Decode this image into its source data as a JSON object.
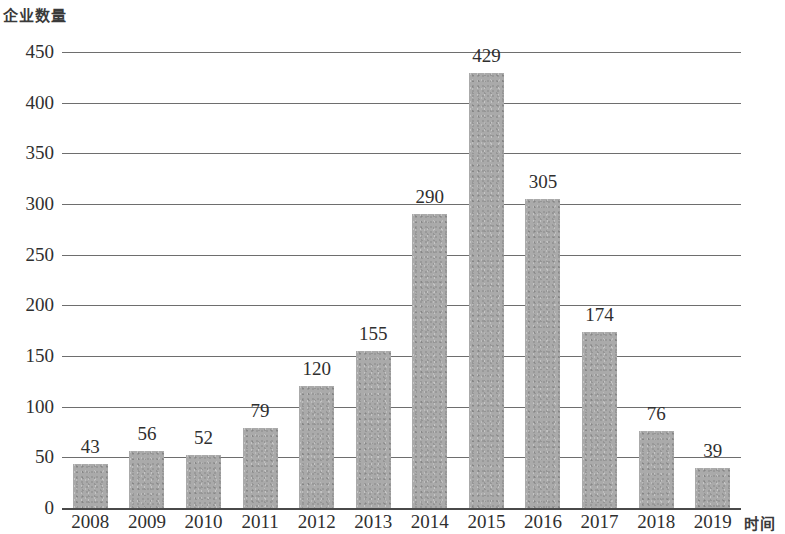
{
  "chart_data": {
    "type": "bar",
    "title": "",
    "ylabel": "企业数量",
    "xlabel": "时间",
    "categories": [
      "2008",
      "2009",
      "2010",
      "2011",
      "2012",
      "2013",
      "2014",
      "2015",
      "2016",
      "2017",
      "2018",
      "2019"
    ],
    "values": [
      43,
      56,
      52,
      79,
      120,
      155,
      290,
      429,
      305,
      174,
      76,
      39
    ],
    "value_labels": [
      "43",
      "56",
      "52",
      "79",
      "120",
      "155",
      "290",
      "429",
      "305",
      "174",
      "76",
      "39"
    ],
    "ylim": [
      0,
      450
    ],
    "ytick_labels": [
      "450",
      "400",
      "350",
      "300",
      "250",
      "200",
      "150",
      "100",
      "50",
      "0"
    ],
    "ytick_values": [
      450,
      400,
      350,
      300,
      250,
      200,
      150,
      100,
      50,
      0
    ],
    "ytick_step": 50,
    "grid": "horizontal",
    "legend": "none",
    "series_color": "#aaaaaa",
    "axis_color": "#6e6e6e"
  }
}
